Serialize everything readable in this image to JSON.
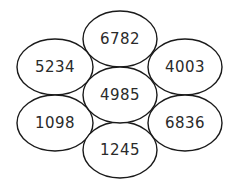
{
  "diagram": {
    "ellipses": [
      {
        "id": "top",
        "value": "6782",
        "cx": 120,
        "cy": 39,
        "rx": 37,
        "ry": 28
      },
      {
        "id": "upper-left",
        "value": "5234",
        "cx": 55,
        "cy": 67,
        "rx": 38,
        "ry": 28
      },
      {
        "id": "upper-right",
        "value": "4003",
        "cx": 185,
        "cy": 67,
        "rx": 37,
        "ry": 28
      },
      {
        "id": "lower-left",
        "value": "1098",
        "cx": 55,
        "cy": 123,
        "rx": 38,
        "ry": 28
      },
      {
        "id": "lower-right",
        "value": "6836",
        "cx": 185,
        "cy": 123,
        "rx": 37,
        "ry": 28
      },
      {
        "id": "bottom",
        "value": "1245",
        "cx": 120,
        "cy": 150,
        "rx": 37,
        "ry": 28
      },
      {
        "id": "center",
        "value": "4985",
        "cx": 120,
        "cy": 95,
        "rx": 37,
        "ry": 28
      }
    ]
  }
}
